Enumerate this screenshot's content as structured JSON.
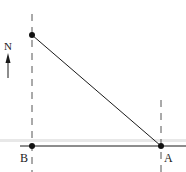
{
  "diagram": {
    "compass": {
      "label": "N",
      "direction": "north"
    },
    "points": {
      "top": {
        "label": ""
      },
      "B": {
        "label": "B"
      },
      "A": {
        "label": "A"
      }
    },
    "colors": {
      "line": "#1a1a1a",
      "dashed": "#555555",
      "band": "#e6e6e6"
    }
  }
}
